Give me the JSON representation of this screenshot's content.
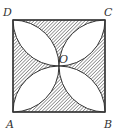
{
  "diagram": {
    "labels": {
      "D": "D",
      "C": "C",
      "A": "A",
      "B": "B",
      "O": "O"
    },
    "colors": {
      "stroke": "#333333",
      "hatch": "#555555",
      "leaf_fill": "#ffffff"
    }
  }
}
